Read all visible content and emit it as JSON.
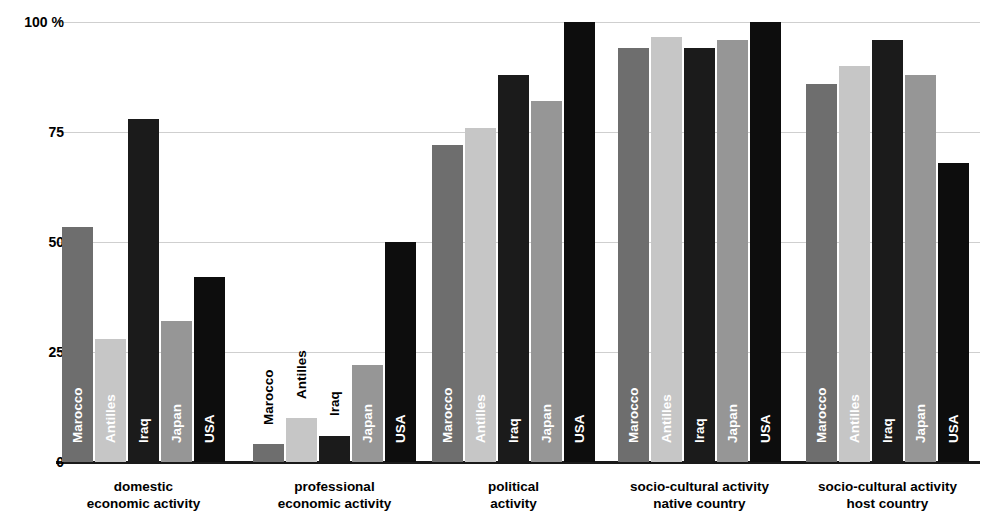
{
  "chart_data": {
    "type": "bar",
    "title": "",
    "subtitle": "",
    "xlabel": "",
    "ylabel": "",
    "ylim": [
      0,
      100
    ],
    "yticks": [
      0,
      25,
      50,
      75,
      100
    ],
    "ytick_labels": [
      "0",
      "25",
      "50",
      "75",
      "100 %"
    ],
    "grid": true,
    "legend_position": "in-bar",
    "categories": [
      "domestic economic activity",
      "professional economic activity",
      "political activity",
      "socio-cultural activity native country",
      "socio-cultural activity host country"
    ],
    "category_lines": [
      [
        "domestic",
        "economic activity"
      ],
      [
        "professional",
        "economic activity"
      ],
      [
        "political",
        "activity"
      ],
      [
        "socio-cultural activity",
        "native country"
      ],
      [
        "socio-cultural activity",
        "host country"
      ]
    ],
    "series": [
      {
        "name": "Marocco",
        "color": "#6e6e6e",
        "values": [
          53.5,
          4,
          72,
          94,
          86
        ]
      },
      {
        "name": "Antilles",
        "color": "#c6c6c6",
        "values": [
          28,
          10,
          76,
          96.5,
          90
        ]
      },
      {
        "name": "Iraq",
        "color": "#1b1b1b",
        "values": [
          78,
          6,
          88,
          94,
          96
        ]
      },
      {
        "name": "Japan",
        "color": "#969696",
        "values": [
          32,
          22,
          82,
          96,
          88
        ]
      },
      {
        "name": "USA",
        "color": "#0d0d0d",
        "values": [
          42,
          50,
          100,
          100,
          68
        ]
      }
    ]
  },
  "axis": {
    "unit_label": "100 %"
  }
}
